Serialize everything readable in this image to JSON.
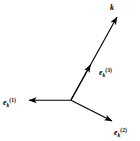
{
  "figure": {
    "title": "",
    "background_color": "#ffffff",
    "stroke_color": "#000000",
    "width": 140,
    "height": 141,
    "origin": {
      "x": 71,
      "y": 100
    },
    "labels": {
      "k": {
        "text": "k",
        "x": 110,
        "y": 3
      },
      "e1": {
        "base": "e",
        "sub": "k",
        "sup": "(1)",
        "x": 3,
        "y": 92
      },
      "e2": {
        "base": "e",
        "sub": "k",
        "sup": "(2)",
        "x": 114,
        "y": 122
      },
      "e3": {
        "base": "e",
        "sub": "k",
        "sup": "(3)",
        "x": 99,
        "y": 62
      }
    },
    "vectors": [
      {
        "name": "wave-vector-k",
        "label": "k",
        "from": {
          "x": 71,
          "y": 100
        },
        "to": {
          "x": 117,
          "y": 17
        },
        "arrowhead": "tip",
        "description": "wave vector k pointing up-right"
      },
      {
        "name": "polarization-vector-3",
        "label": "e_k^(3)",
        "from": {
          "x": 71,
          "y": 100
        },
        "to": {
          "x": 90,
          "y": 66
        },
        "arrowhead": "mid",
        "description": "longitudinal polarization unit vector along k"
      },
      {
        "name": "polarization-vector-1",
        "label": "e_k^(1)",
        "from": {
          "x": 71,
          "y": 100
        },
        "to": {
          "x": 29,
          "y": 100
        },
        "arrowhead": "tip",
        "description": "transverse polarization unit vector pointing left"
      },
      {
        "name": "polarization-vector-2",
        "label": "e_k^(2)",
        "from": {
          "x": 71,
          "y": 100
        },
        "to": {
          "x": 112,
          "y": 121
        },
        "arrowhead": "tip",
        "description": "transverse polarization unit vector pointing down-right"
      }
    ]
  }
}
